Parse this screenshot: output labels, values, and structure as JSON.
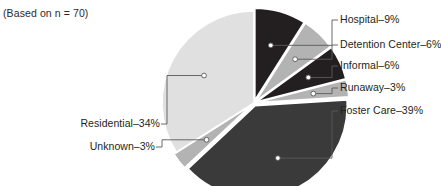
{
  "figure": {
    "note": "(Based on n = 70)",
    "background": "#ffffff"
  },
  "chart_data": {
    "type": "pie",
    "title": "",
    "subtitle": "(Based on n = 70)",
    "xlabel": "",
    "ylabel": "",
    "grid": false,
    "legend_position": "callout-labels",
    "n": 70,
    "units": "percent",
    "start_angle_deg": 0,
    "direction": "clockwise",
    "categories": [
      "Hospital",
      "Detention Center",
      "Informal",
      "Runaway",
      "Foster Care",
      "Unknown",
      "Residential"
    ],
    "values": [
      9,
      6,
      6,
      3,
      39,
      3,
      34
    ],
    "labels": [
      "Hospital–9%",
      "Detention Center–6%",
      "Informal–6%",
      "Runaway–3%",
      "Foster Care–39%",
      "Unknown–3%",
      "Residential–34%"
    ],
    "colors": [
      "#231f20",
      "#b3b3b3",
      "#231f20",
      "#b3b3b3",
      "#3a3a3a",
      "#b3b3b3",
      "#e0e0e0"
    ],
    "slices": [
      {
        "name": "Hospital",
        "value": 9,
        "label": "Hospital–9%",
        "color": "#231f20",
        "side": "right"
      },
      {
        "name": "Detention Center",
        "value": 6,
        "label": "Detention Center–6%",
        "color": "#b3b3b3",
        "side": "right"
      },
      {
        "name": "Informal",
        "value": 6,
        "label": "Informal–6%",
        "color": "#231f20",
        "side": "right"
      },
      {
        "name": "Runaway",
        "value": 3,
        "label": "Runaway–3%",
        "color": "#b3b3b3",
        "side": "right"
      },
      {
        "name": "Foster Care",
        "value": 39,
        "label": "Foster Care–39%",
        "color": "#3a3a3a",
        "side": "right"
      },
      {
        "name": "Unknown",
        "value": 3,
        "label": "Unknown–3%",
        "color": "#b3b3b3",
        "side": "left"
      },
      {
        "name": "Residential",
        "value": 34,
        "label": "Residential–34%",
        "color": "#e0e0e0",
        "side": "left"
      }
    ]
  }
}
